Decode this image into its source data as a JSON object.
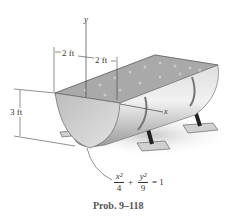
{
  "figure": {
    "axis_labels": {
      "y": "y",
      "x": "x"
    },
    "dimensions": {
      "left_width": "2 ft",
      "right_width": "2 ft",
      "height": "3 ft"
    },
    "equation": {
      "term1_num": "x²",
      "term1_den": "4",
      "plus": "+",
      "term2_num": "y²",
      "term2_den": "9",
      "equals": "= 1"
    },
    "caption": "Prob. 9–118",
    "colors": {
      "water": "#a9a9a9",
      "trough_face": "#c8c8c8",
      "trough_dark": "#8a8a8a",
      "support": "#222222",
      "line": "#444444"
    }
  }
}
